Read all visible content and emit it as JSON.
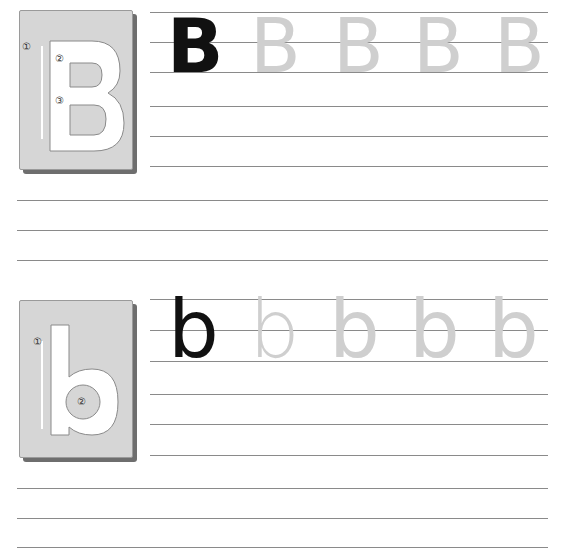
{
  "worksheet": {
    "sections": [
      {
        "id": "uppercase",
        "card": {
          "letter": "B",
          "stroke_labels": [
            "①",
            "②",
            "③"
          ]
        },
        "model_letter": "B",
        "trace_letters": [
          "B",
          "B",
          "B",
          "B"
        ]
      },
      {
        "id": "lowercase",
        "card": {
          "letter": "b",
          "stroke_labels": [
            "①",
            "②"
          ]
        },
        "model_letter": "b",
        "trace_letters": [
          "b",
          "b",
          "b",
          "b"
        ]
      }
    ],
    "colors": {
      "model": "#111111",
      "trace": "#cfcfcf",
      "card_face": "#d6d6d6",
      "card_shadow": "#6e6e6e",
      "rule_line": "#8a8a8a"
    }
  }
}
